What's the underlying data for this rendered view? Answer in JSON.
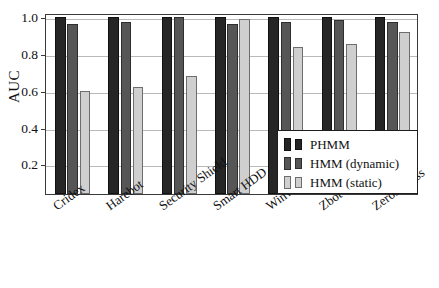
{
  "chart_data": {
    "type": "bar",
    "title": "",
    "xlabel": "",
    "ylabel": "AUC",
    "ylim": [
      0.04,
      1.02
    ],
    "ytick_values": [
      0.2,
      0.4,
      0.6,
      0.8,
      1.0
    ],
    "ytick_labels": [
      "0.2",
      "0.4",
      "0.6",
      "0.8",
      "1.0"
    ],
    "grid": true,
    "legend_position": "lower right",
    "categories": [
      "Cridex",
      "Harebot",
      "Security Shield",
      "Smart HDD",
      "Winwebsec",
      "Zbot",
      "ZeroAccess"
    ],
    "series": [
      {
        "name": "PHMM",
        "color": "#262626",
        "values": [
          1.0,
          1.0,
          1.0,
          1.0,
          1.0,
          1.0,
          1.0
        ]
      },
      {
        "name": "HMM (dynamic)",
        "color": "#565656",
        "values": [
          0.96,
          0.97,
          1.0,
          0.96,
          0.97,
          0.98,
          0.97
        ]
      },
      {
        "name": "HMM (static)",
        "color": "#cfcfcf",
        "values": [
          0.6,
          0.62,
          0.68,
          0.99,
          0.835,
          0.85,
          0.92
        ]
      }
    ]
  },
  "legend": {
    "items": [
      {
        "label": "PHMM"
      },
      {
        "label": "HMM (dynamic)"
      },
      {
        "label": "HMM (static)"
      }
    ]
  }
}
